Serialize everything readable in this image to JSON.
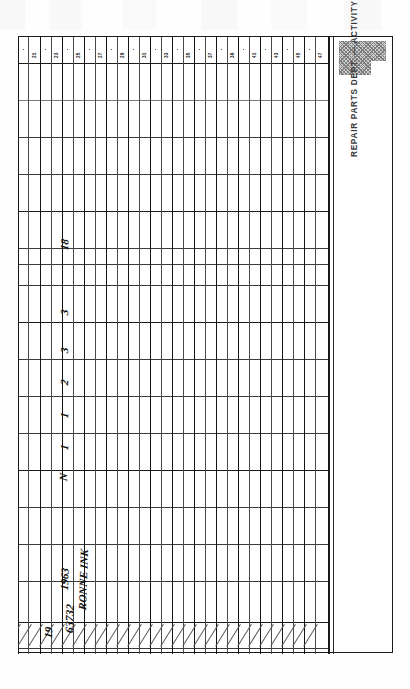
{
  "document": {
    "type": "scanned-ledger-card",
    "caption": "REPAIR PARTS DEPT. — ACTIVITY — STORES RECORD",
    "orientation": "rotated-90-ccw"
  },
  "column_headers": [
    "21",
    "23",
    "25",
    "27",
    "29",
    "31",
    "33",
    "35",
    "37",
    "39",
    "41",
    "43",
    "45",
    "47",
    "49",
    "51"
  ],
  "entries": {
    "year": "1963",
    "name": "RONNE INK",
    "part_number": "63732",
    "line_number": "19",
    "code": "N",
    "quantities": [
      "1",
      "1",
      "2",
      "3",
      "3",
      "18"
    ]
  },
  "marks": {
    "hatched_block": "gray-hatched-shading",
    "cancellation": "diagonal-slashes-bottom-row"
  },
  "colors": {
    "paper": "#fefefe",
    "rule_dark": "#1a1a1a",
    "rule_light": "#7a7a7a",
    "ink": "#0f0f0f",
    "caption": "#3a3a3a",
    "hatch": "#c9c9c9"
  }
}
